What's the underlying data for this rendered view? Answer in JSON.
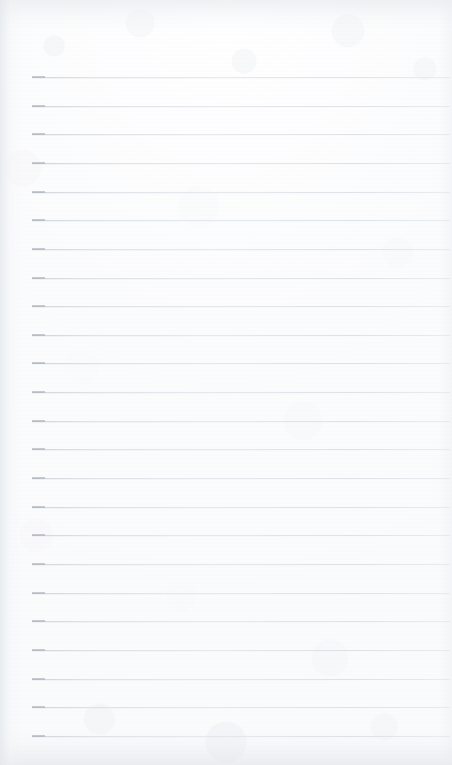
{
  "document": {
    "kind": "ruled-notebook-page",
    "title": "",
    "body_text": "",
    "page_width": 452,
    "page_height": 765,
    "is_blank": true
  },
  "paper": {
    "background_color": "#fdfdfd",
    "texture": "scanned-paper-grain",
    "top_edge_shading": "#e2e5e9",
    "bottom_edge_shading": "#e0e4e8",
    "left_edge_shading": "#e3e7eb",
    "right_edge_shading": "#eaedf0"
  },
  "ruling": {
    "line_color": "#dde1e6",
    "line_cap_color": "#b0b6bd",
    "line_count": 24,
    "line_thickness_px": 1,
    "first_line_y": 77,
    "line_spacing_px": 28.65,
    "left_margin_x": 32,
    "right_end_x": 450,
    "header_zone_height": 77,
    "lines": [
      {
        "index": 1,
        "y": 77
      },
      {
        "index": 2,
        "y": 106
      },
      {
        "index": 3,
        "y": 134
      },
      {
        "index": 4,
        "y": 163
      },
      {
        "index": 5,
        "y": 192
      },
      {
        "index": 6,
        "y": 220
      },
      {
        "index": 7,
        "y": 249
      },
      {
        "index": 8,
        "y": 278
      },
      {
        "index": 9,
        "y": 306
      },
      {
        "index": 10,
        "y": 335
      },
      {
        "index": 11,
        "y": 363
      },
      {
        "index": 12,
        "y": 392
      },
      {
        "index": 13,
        "y": 421
      },
      {
        "index": 14,
        "y": 449
      },
      {
        "index": 15,
        "y": 478
      },
      {
        "index": 16,
        "y": 507
      },
      {
        "index": 17,
        "y": 535
      },
      {
        "index": 18,
        "y": 564
      },
      {
        "index": 19,
        "y": 593
      },
      {
        "index": 20,
        "y": 621
      },
      {
        "index": 21,
        "y": 650
      },
      {
        "index": 22,
        "y": 679
      },
      {
        "index": 23,
        "y": 707
      },
      {
        "index": 24,
        "y": 736
      }
    ]
  }
}
